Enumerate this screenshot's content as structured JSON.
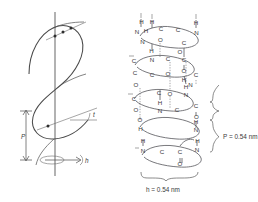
{
  "figure": {
    "type": "scientific-diagram",
    "background_color": "#ffffff",
    "ink_color": "#3a3a3a"
  },
  "left_panel": {
    "name": "helix-geometry-diagram",
    "description": "Single helical curve drawn about a vertical axis, with pitch and rise measurements",
    "axis_label": "",
    "labels": {
      "pitch_symbol": "P",
      "rise_symbol": "h",
      "angle_symbol": "t"
    }
  },
  "right_panel": {
    "name": "alpha-helix-structure",
    "description": "Ball-and-stick style alpha helix backbone with C, N, O and H atoms and dashed hydrogen bonds",
    "dimensions": [
      {
        "id": "pitch",
        "label": "P = 0.54 nm",
        "symbol": "P",
        "value": "0.54",
        "unit": "nm",
        "orientation": "vertical"
      },
      {
        "id": "rise",
        "label": "h = 0.54 nm",
        "symbol": "h",
        "value": "0.54",
        "unit": "nm",
        "orientation": "horizontal"
      }
    ],
    "atom_labels": [
      {
        "id": "a01",
        "text": "H",
        "x": 141.5,
        "y": 24.0
      },
      {
        "id": "a02",
        "text": "N",
        "x": 137.0,
        "y": 33.5
      },
      {
        "id": "a03",
        "text": "H",
        "x": 146.0,
        "y": 33.0
      },
      {
        "id": "a04",
        "text": "C",
        "x": 161.0,
        "y": 31.0
      },
      {
        "id": "a05",
        "text": "C",
        "x": 178.0,
        "y": 31.5
      },
      {
        "id": "a06",
        "text": "H",
        "x": 152.0,
        "y": 24.0
      },
      {
        "id": "a07",
        "text": "H",
        "x": 196.0,
        "y": 24.5
      },
      {
        "id": "a08",
        "text": "N",
        "x": 196.5,
        "y": 34.5
      },
      {
        "id": "a09",
        "text": "N",
        "x": 142.5,
        "y": 43.5
      },
      {
        "id": "a10",
        "text": "O",
        "x": 160.5,
        "y": 41.5
      },
      {
        "id": "a11",
        "text": "C",
        "x": 184.0,
        "y": 44.5
      },
      {
        "id": "a12",
        "text": "H",
        "x": 151.5,
        "y": 53.0
      },
      {
        "id": "a13",
        "text": "O",
        "x": 180.0,
        "y": 54.0
      },
      {
        "id": "a14",
        "text": "N",
        "x": 152.0,
        "y": 62.0
      },
      {
        "id": "a15",
        "text": "C",
        "x": 168.0,
        "y": 61.0
      },
      {
        "id": "a16",
        "text": "C",
        "x": 184.0,
        "y": 61.5
      },
      {
        "id": "a17",
        "text": "C",
        "x": 134.0,
        "y": 62.5
      },
      {
        "id": "a18",
        "text": "O",
        "x": 184.0,
        "y": 72.5
      },
      {
        "id": "a19",
        "text": "C",
        "x": 135.0,
        "y": 75.0
      },
      {
        "id": "a20",
        "text": "C",
        "x": 152.0,
        "y": 77.0
      },
      {
        "id": "a21",
        "text": "O",
        "x": 168.0,
        "y": 76.0
      },
      {
        "id": "a22",
        "text": "H",
        "x": 184.0,
        "y": 82.0
      },
      {
        "id": "a23",
        "text": "C",
        "x": 196.0,
        "y": 77.0
      },
      {
        "id": "a24",
        "text": "N",
        "x": 190.5,
        "y": 86.5
      },
      {
        "id": "a25",
        "text": "O",
        "x": 136.0,
        "y": 87.0
      },
      {
        "id": "a26",
        "text": "C",
        "x": 159.0,
        "y": 95.0
      },
      {
        "id": "a27",
        "text": "O",
        "x": 170.0,
        "y": 95.5
      },
      {
        "id": "a28",
        "text": "N",
        "x": 186.0,
        "y": 97.0
      },
      {
        "id": "a29",
        "text": "H",
        "x": 186.0,
        "y": 89.0
      },
      {
        "id": "a30",
        "text": "C",
        "x": 134.0,
        "y": 101.0
      },
      {
        "id": "a31",
        "text": "O",
        "x": 136.0,
        "y": 112.0
      },
      {
        "id": "a32",
        "text": "H",
        "x": 160.0,
        "y": 105.0
      },
      {
        "id": "a33",
        "text": "N",
        "x": 160.0,
        "y": 113.0
      },
      {
        "id": "a34",
        "text": "C",
        "x": 177.0,
        "y": 112.0
      },
      {
        "id": "a35",
        "text": "C",
        "x": 196.0,
        "y": 108.0
      },
      {
        "id": "a36",
        "text": "O",
        "x": 196.5,
        "y": 119.0
      },
      {
        "id": "a37",
        "text": "O",
        "x": 140.0,
        "y": 122.0
      },
      {
        "id": "a38",
        "text": "H",
        "x": 140.5,
        "y": 131.0
      },
      {
        "id": "a39",
        "text": "N",
        "x": 196.0,
        "y": 131.5
      },
      {
        "id": "a40",
        "text": "H",
        "x": 196.0,
        "y": 124.0
      },
      {
        "id": "a41",
        "text": "H",
        "x": 143.0,
        "y": 143.0
      },
      {
        "id": "a42",
        "text": "N",
        "x": 143.0,
        "y": 152.5
      },
      {
        "id": "a43",
        "text": "C",
        "x": 162.0,
        "y": 154.0
      },
      {
        "id": "a44",
        "text": "C",
        "x": 180.0,
        "y": 154.0
      },
      {
        "id": "a45",
        "text": "O",
        "x": 180.0,
        "y": 166.0
      },
      {
        "id": "a46",
        "text": "N",
        "x": 197.0,
        "y": 151.5
      },
      {
        "id": "a47",
        "text": "H",
        "x": 197.5,
        "y": 143.0
      }
    ]
  }
}
